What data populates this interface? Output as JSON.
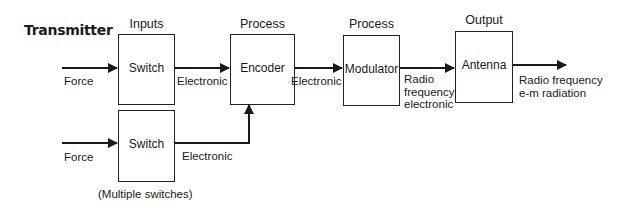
{
  "title": "Transmitter",
  "stages": [
    {
      "header": "Inputs",
      "block": "Switch"
    },
    {
      "header": "Process",
      "block": "Encoder"
    },
    {
      "header": "Process",
      "block": "Modulator"
    },
    {
      "header": "Output",
      "block": "Antenna"
    }
  ],
  "second_input": {
    "block": "Switch",
    "note": "(Multiple switches)"
  },
  "signals": {
    "force_1": "Force",
    "force_2": "Force",
    "switch_to_encoder": "Electronic",
    "switch2_to_encoder": "Electronic",
    "encoder_to_modulator": "Electronic",
    "modulator_to_antenna": [
      "Radio",
      "frequency",
      "electronic"
    ],
    "antenna_out": [
      "Radio frequency",
      "e-m radiation"
    ]
  },
  "colors": {
    "line": "#1a1a1a",
    "background": "#ffffff"
  }
}
